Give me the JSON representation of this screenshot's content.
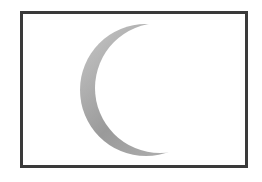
{
  "image": {
    "subject": "crescent-moon",
    "colors": {
      "border": "#3a3a3a",
      "background": "#ffffff",
      "crescent_light": "#cfcfcf",
      "crescent_dark": "#8e8e8e"
    }
  }
}
